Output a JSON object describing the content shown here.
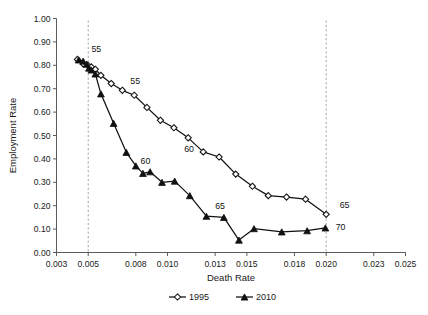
{
  "chart_data": {
    "type": "line",
    "title": "",
    "xlabel": "Death Rate",
    "ylabel": "Employment Rate",
    "xlim": [
      0.003,
      0.025
    ],
    "ylim": [
      0.0,
      1.0
    ],
    "grid": false,
    "legend_position": "bottom",
    "x_ticks": [
      "0.003",
      "0.005",
      "0.008",
      "0.010",
      "0.013",
      "0.015",
      "0.018",
      "0.020",
      "0.023",
      "0.025"
    ],
    "x_tick_values": [
      0.003,
      0.005,
      0.008,
      0.01,
      0.013,
      0.015,
      0.018,
      0.02,
      0.023,
      0.025
    ],
    "y_ticks": [
      "0.00",
      "0.10",
      "0.20",
      "0.30",
      "0.40",
      "0.50",
      "0.60",
      "0.70",
      "0.80",
      "0.90",
      "1.00"
    ],
    "y_tick_values": [
      0.0,
      0.1,
      0.2,
      0.3,
      0.4,
      0.5,
      0.6,
      0.7,
      0.8,
      0.9,
      1.0
    ],
    "series": [
      {
        "name": "1995",
        "marker": "open-diamond",
        "color": "#111111",
        "points": [
          [
            0.00432,
            0.825
          ],
          [
            0.0047,
            0.805
          ],
          [
            0.00497,
            0.8
          ],
          [
            0.0052,
            0.793
          ],
          [
            0.00545,
            0.783
          ],
          [
            0.0058,
            0.757
          ],
          [
            0.00645,
            0.722
          ],
          [
            0.00715,
            0.693
          ],
          [
            0.0079,
            0.672
          ],
          [
            0.0087,
            0.62
          ],
          [
            0.00955,
            0.565
          ],
          [
            0.0104,
            0.533
          ],
          [
            0.0113,
            0.49
          ],
          [
            0.01225,
            0.43
          ],
          [
            0.01325,
            0.408
          ],
          [
            0.0143,
            0.335
          ],
          [
            0.01535,
            0.283
          ],
          [
            0.01635,
            0.243
          ],
          [
            0.0175,
            0.237
          ],
          [
            0.0187,
            0.228
          ],
          [
            0.02,
            0.163
          ]
        ]
      },
      {
        "name": "2010",
        "marker": "filled-triangle",
        "color": "#111111",
        "points": [
          [
            0.0044,
            0.823
          ],
          [
            0.00468,
            0.818
          ],
          [
            0.0049,
            0.805
          ],
          [
            0.00505,
            0.788
          ],
          [
            0.0052,
            0.78
          ],
          [
            0.00545,
            0.763
          ],
          [
            0.0058,
            0.678
          ],
          [
            0.0066,
            0.552
          ],
          [
            0.0074,
            0.428
          ],
          [
            0.008,
            0.37
          ],
          [
            0.00845,
            0.338
          ],
          [
            0.0089,
            0.345
          ],
          [
            0.00965,
            0.3
          ],
          [
            0.01045,
            0.305
          ],
          [
            0.0114,
            0.243
          ],
          [
            0.01245,
            0.155
          ],
          [
            0.01355,
            0.15
          ],
          [
            0.0145,
            0.053
          ],
          [
            0.01545,
            0.102
          ],
          [
            0.0172,
            0.088
          ],
          [
            0.0188,
            0.093
          ],
          [
            0.01995,
            0.105
          ]
        ]
      }
    ],
    "annotations": [
      {
        "text": "55",
        "x": 0.0052,
        "y": 0.87,
        "series": "2010"
      },
      {
        "text": "55",
        "x": 0.00765,
        "y": 0.735,
        "series": "1995"
      },
      {
        "text": "60",
        "x": 0.01105,
        "y": 0.443,
        "series": "1995"
      },
      {
        "text": "60",
        "x": 0.0083,
        "y": 0.393,
        "series": "2010"
      },
      {
        "text": "65",
        "x": 0.013,
        "y": 0.2,
        "series": "2010"
      },
      {
        "text": "65",
        "x": 0.02085,
        "y": 0.205,
        "series": "1995"
      },
      {
        "text": "70",
        "x": 0.0206,
        "y": 0.108,
        "series": "2010"
      }
    ],
    "reference_lines": [
      {
        "x": 0.005,
        "style": "dashed"
      },
      {
        "x": 0.02,
        "style": "dashed"
      }
    ]
  },
  "legend": {
    "entries": [
      {
        "label": "1995",
        "marker": "open-diamond"
      },
      {
        "label": "2010",
        "marker": "filled-triangle"
      }
    ]
  }
}
